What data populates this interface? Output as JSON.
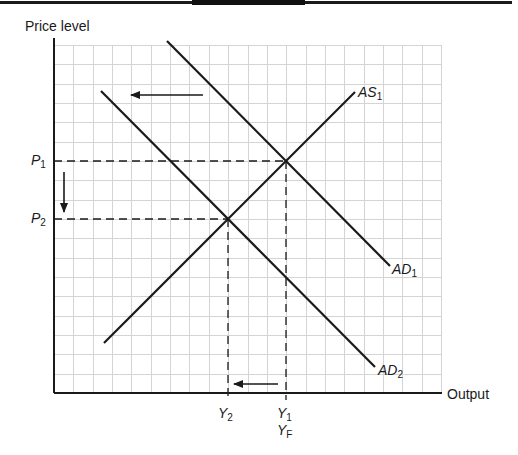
{
  "diagram": {
    "y_axis_label": "Price level",
    "x_axis_label": "Output",
    "curves": [
      {
        "id": "AS1",
        "name": "AS",
        "subscript": "1",
        "type": "aggregate-supply",
        "from": [
          104,
          343
        ],
        "to": [
          355,
          92
        ]
      },
      {
        "id": "AD1",
        "name": "AD",
        "subscript": "1",
        "type": "aggregate-demand",
        "from": [
          167,
          41
        ],
        "to": [
          390,
          266
        ]
      },
      {
        "id": "AD2",
        "name": "AD",
        "subscript": "2",
        "type": "aggregate-demand",
        "from": [
          101,
          91
        ],
        "to": [
          375,
          367
        ]
      }
    ],
    "price_levels": [
      {
        "name": "P",
        "subscript": "1",
        "y": 161
      },
      {
        "name": "P",
        "subscript": "2",
        "y": 219
      }
    ],
    "output_levels": [
      {
        "name": "Y",
        "subscript": "2",
        "x": 228
      },
      {
        "name": "Y",
        "subscript": "1",
        "x": 286,
        "secondary": {
          "name": "Y",
          "subscript": "F"
        }
      }
    ],
    "equilibria": [
      {
        "label": "AS1 ∩ AD1",
        "x": 286,
        "y": 161
      },
      {
        "label": "AS1 ∩ AD2",
        "x": 228,
        "y": 219
      }
    ],
    "arrows": [
      {
        "meaning": "AD shifts left",
        "from": [
          203,
          95
        ],
        "to": [
          131,
          95
        ]
      },
      {
        "meaning": "price level falls",
        "from": [
          64,
          172
        ],
        "to": [
          64,
          212
        ]
      },
      {
        "meaning": "output falls",
        "from": [
          278,
          384
        ],
        "to": [
          234,
          384
        ]
      }
    ],
    "grid": {
      "x0": 54,
      "y0": 45,
      "x1": 441,
      "y1": 393,
      "cols": 20,
      "rows": 18,
      "color": "#d4d4d4"
    },
    "colors": {
      "line": "#1a1a1a",
      "grid": "#d4d4d4",
      "background": "#ffffff"
    }
  }
}
